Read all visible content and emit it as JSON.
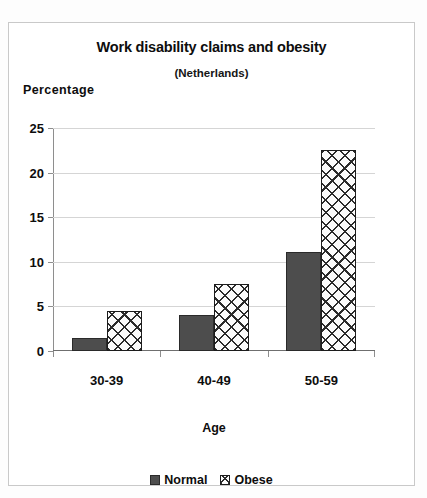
{
  "chart_data": {
    "type": "bar",
    "title": "Work disability claims and obesity",
    "subtitle": "(Netherlands)",
    "xlabel": "Age",
    "ylabel": "Percentage",
    "categories": [
      "30-39",
      "40-49",
      "50-59"
    ],
    "series": [
      {
        "name": "Normal",
        "values": [
          1.5,
          4.0,
          11.1
        ],
        "color": "#4d4d4d",
        "fill": "solid-dark-gray"
      },
      {
        "name": "Obese",
        "values": [
          4.5,
          7.5,
          22.5
        ],
        "color": "#ffffff",
        "fill": "crosshatch"
      }
    ],
    "ylim": [
      0,
      25
    ],
    "ytick_labels": [
      "0",
      "5",
      "10",
      "15",
      "20",
      "25"
    ],
    "ytick_values": [
      0,
      5,
      10,
      15,
      20,
      25
    ],
    "grid": true,
    "legend_position": "bottom"
  },
  "legend": {
    "items": [
      {
        "label": "Normal",
        "swatch": "solid-dark-gray-swatch"
      },
      {
        "label": "Obese",
        "swatch": "crosshatch-swatch"
      }
    ]
  },
  "colors": {
    "normal_bar": "#4d4d4d",
    "obese_bar": "#ffffff",
    "hatch": "#2b2b2b",
    "gridline": "#d5d5d5",
    "axis": "#8e8e8e",
    "border": "#c9c9c9",
    "text": "#0d0d0d",
    "background": "#ffffff"
  }
}
